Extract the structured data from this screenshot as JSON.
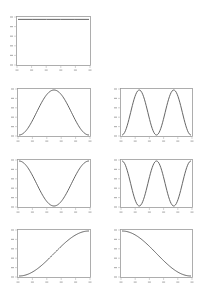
{
  "figure": {
    "width": 206,
    "height": 295,
    "line_color": "#555555",
    "frame_color": "#9a9a9a",
    "tick_color": "#b5b5b5"
  },
  "chart_data": [
    {
      "type": "line",
      "title": "",
      "xlabel": "",
      "ylabel": "",
      "description": "constant line near top of axes",
      "x": [
        0,
        0.2,
        0.4,
        0.6,
        0.8,
        1.0
      ],
      "values": [
        0.97,
        0.97,
        0.97,
        0.97,
        0.97,
        0.97
      ],
      "xlim": [
        0,
        1
      ],
      "ylim": [
        0,
        1
      ],
      "x_ticks": 6,
      "y_ticks": 6,
      "grid": false,
      "frame": {
        "left": 16,
        "top": 16,
        "right": 91,
        "bottom": 66
      }
    },
    {
      "type": "line",
      "description": "single raised-cosine bump (0 -> 1 -> 0)",
      "function": "0.5 - 0.5*cos(2*pi*x)",
      "xlim": [
        0,
        1
      ],
      "ylim": [
        0,
        1
      ],
      "x_ticks": 6,
      "y_ticks": 6,
      "grid": false,
      "frame": {
        "left": 17,
        "top": 88,
        "right": 91,
        "bottom": 137
      }
    },
    {
      "type": "line",
      "description": "two raised-cosine bumps",
      "function": "0.5 - 0.5*cos(4*pi*x)",
      "xlim": [
        0,
        1
      ],
      "ylim": [
        0,
        1
      ],
      "x_ticks": 6,
      "y_ticks": 6,
      "grid": false,
      "frame": {
        "left": 120,
        "top": 88,
        "right": 193,
        "bottom": 137
      }
    },
    {
      "type": "line",
      "description": "single cosine dip (1 -> 0 -> 1)",
      "function": "0.5 + 0.5*cos(2*pi*x)",
      "xlim": [
        0,
        1
      ],
      "ylim": [
        0,
        1
      ],
      "x_ticks": 6,
      "y_ticks": 6,
      "grid": false,
      "frame": {
        "left": 17,
        "top": 159,
        "right": 91,
        "bottom": 208
      }
    },
    {
      "type": "line",
      "description": "two cosine dips",
      "function": "0.5 + 0.5*cos(4*pi*x)",
      "xlim": [
        0,
        1
      ],
      "ylim": [
        0,
        1
      ],
      "x_ticks": 6,
      "y_ticks": 6,
      "grid": false,
      "frame": {
        "left": 120,
        "top": 159,
        "right": 193,
        "bottom": 208
      }
    },
    {
      "type": "line",
      "description": "rising half-cosine (S-curve 0 -> 1)",
      "function": "0.5 - 0.5*cos(pi*x)",
      "xlim": [
        0,
        1
      ],
      "ylim": [
        0,
        1
      ],
      "x_ticks": 6,
      "y_ticks": 6,
      "grid": false,
      "frame": {
        "left": 17,
        "top": 229,
        "right": 91,
        "bottom": 278
      }
    },
    {
      "type": "line",
      "description": "falling half-cosine (S-curve 1 -> 0)",
      "function": "0.5 + 0.5*cos(pi*x)",
      "xlim": [
        0,
        1
      ],
      "ylim": [
        0,
        1
      ],
      "x_ticks": 6,
      "y_ticks": 6,
      "grid": false,
      "frame": {
        "left": 120,
        "top": 229,
        "right": 193,
        "bottom": 278
      }
    }
  ]
}
